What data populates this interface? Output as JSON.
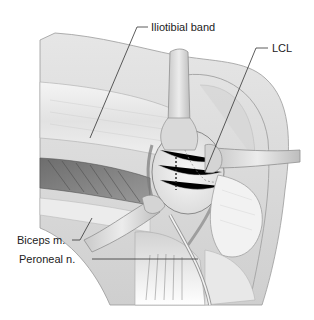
{
  "figure": {
    "top_caption_fragment": "",
    "labels": {
      "iliotibial_band": "Iliotibial band",
      "lcl": "LCL",
      "biceps": "Biceps m.",
      "peroneal": "Peroneal n."
    }
  }
}
